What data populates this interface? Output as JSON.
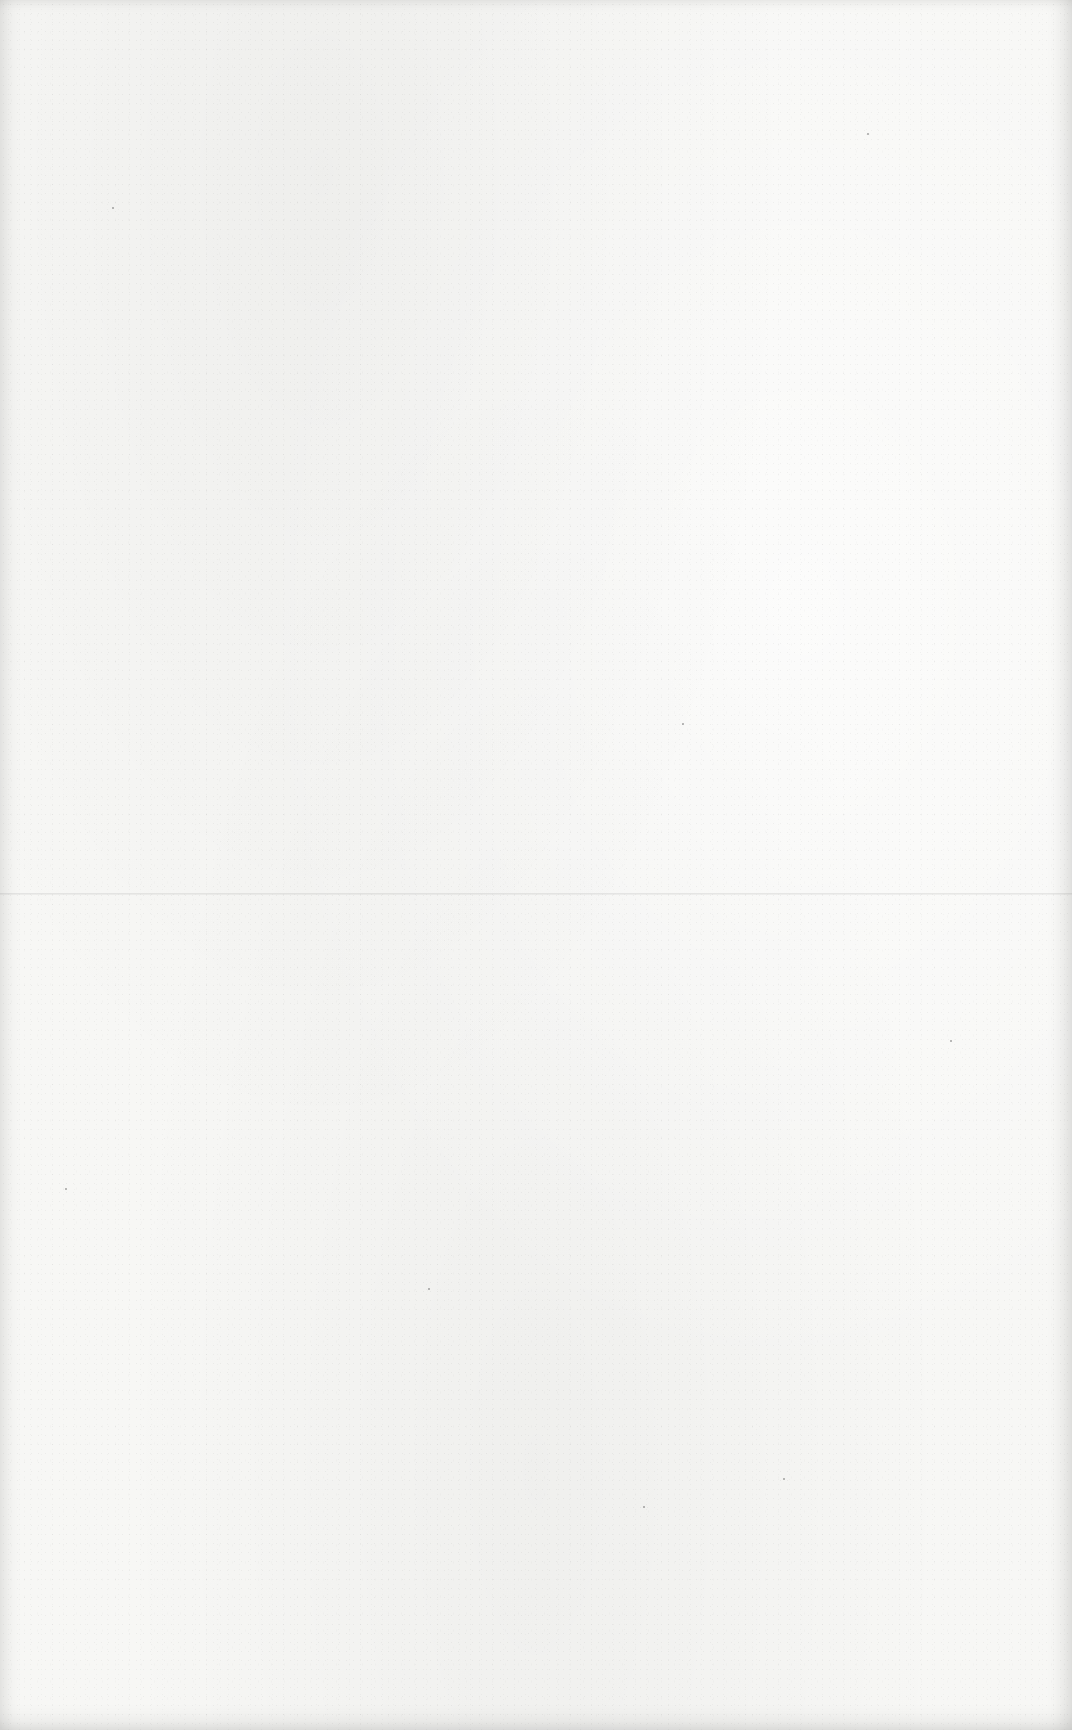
{
  "page": {
    "type": "blank-paper-scan",
    "background_color": "#f7f7f5",
    "fold_line": {
      "orientation": "horizontal",
      "y": 893,
      "color": "#d8d8d8"
    },
    "specks": [
      {
        "x": 112,
        "y": 207
      },
      {
        "x": 428,
        "y": 1288
      },
      {
        "x": 682,
        "y": 723
      },
      {
        "x": 867,
        "y": 133
      },
      {
        "x": 783,
        "y": 1478
      },
      {
        "x": 643,
        "y": 1506
      },
      {
        "x": 65,
        "y": 1188
      },
      {
        "x": 950,
        "y": 1040
      }
    ]
  }
}
